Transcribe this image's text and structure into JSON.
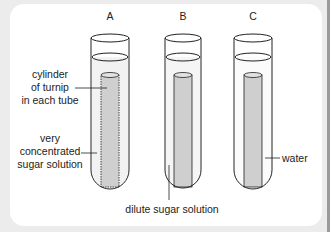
{
  "figure": {
    "tubes": [
      {
        "id": "A",
        "label": "A"
      },
      {
        "id": "B",
        "label": "B"
      },
      {
        "id": "C",
        "label": "C"
      }
    ],
    "annotations": {
      "cylinder": [
        "cylinder",
        "of turnip",
        "in each tube"
      ],
      "concentrated": [
        "very",
        "concentrated",
        "sugar solution"
      ],
      "dilute": "dilute sugar solution",
      "water": "water"
    },
    "colors": {
      "background": "#ececec",
      "panel": "#ffffff",
      "line": "#222222",
      "turnip_fill": "#cfcfcf",
      "solution_fill": "#efefef"
    }
  }
}
